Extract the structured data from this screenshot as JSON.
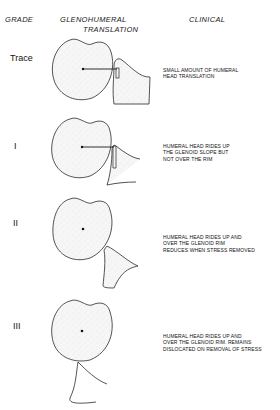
{
  "headers": {
    "grade": "GRADE",
    "translation_line1": "GLENOHUMERAL",
    "translation_line2": "TRANSLATION",
    "clinical": "CLINICAL"
  },
  "rows": [
    {
      "grade": "Trace",
      "clinical": [
        "SMALL AMOUNT OF HUMERAL",
        "HEAD TRANSLATION"
      ]
    },
    {
      "grade": "I",
      "clinical": [
        "HUMERAL HEAD RIDES UP",
        "THE GLENOID SLOPE BUT",
        "NOT OVER THE RIM"
      ]
    },
    {
      "grade": "II",
      "clinical": [
        "HUMERAL HEAD RIDES UP AND",
        "OVER THE GLENOID RIM",
        "REDUCES WHEN STRESS REMOVED"
      ]
    },
    {
      "grade": "III",
      "clinical": [
        "HUMERAL HEAD RIDES UP AND",
        "OVER THE GLENOID RIM. REMAINS",
        "DISLOCATED ON REMOVAL OF STRESS"
      ]
    }
  ],
  "colors": {
    "line": "#2a2a2a",
    "fill": "#f4f4f4"
  }
}
